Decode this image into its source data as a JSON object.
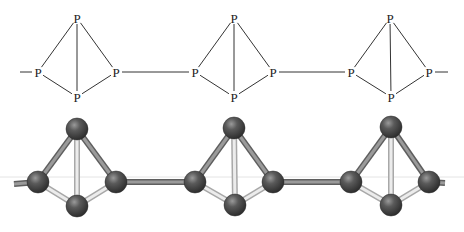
{
  "figure": {
    "element_label": "P",
    "colors": {
      "line": "#333333",
      "atom_dark": "#3a3a3a",
      "atom_highlight": "#8a8a8a",
      "bond_light": "#d8d8d8",
      "bond_dark": "#7a7a7a",
      "guide_line": "#e4e4e4"
    }
  },
  "structural_formula": {
    "units": [
      {
        "atoms": [
          {
            "id": "top",
            "label": "P",
            "x": 77,
            "y": 18
          },
          {
            "id": "left",
            "label": "P",
            "x": 38,
            "y": 72
          },
          {
            "id": "right",
            "label": "P",
            "x": 116,
            "y": 72
          },
          {
            "id": "bottom",
            "label": "P",
            "x": 77,
            "y": 97
          }
        ]
      },
      {
        "atoms": [
          {
            "id": "top",
            "label": "P",
            "x": 234,
            "y": 18
          },
          {
            "id": "left",
            "label": "P",
            "x": 195,
            "y": 72
          },
          {
            "id": "right",
            "label": "P",
            "x": 273,
            "y": 72
          },
          {
            "id": "bottom",
            "label": "P",
            "x": 234,
            "y": 97
          }
        ]
      },
      {
        "atoms": [
          {
            "id": "top",
            "label": "P",
            "x": 390,
            "y": 18
          },
          {
            "id": "left",
            "label": "P",
            "x": 351,
            "y": 72
          },
          {
            "id": "right",
            "label": "P",
            "x": 429,
            "y": 72
          },
          {
            "id": "bottom",
            "label": "P",
            "x": 391,
            "y": 97
          }
        ]
      }
    ],
    "chain_ends": {
      "left_start_x": 20,
      "right_end_x": 448,
      "y": 72
    }
  },
  "ball_and_stick": {
    "atom_radius": 11,
    "units": [
      {
        "atoms": [
          {
            "id": "top",
            "x": 77,
            "y": 129
          },
          {
            "id": "left",
            "x": 38,
            "y": 182
          },
          {
            "id": "right",
            "x": 116,
            "y": 182
          },
          {
            "id": "bottom",
            "x": 77,
            "y": 206
          }
        ]
      },
      {
        "atoms": [
          {
            "id": "top",
            "x": 234,
            "y": 128
          },
          {
            "id": "left",
            "x": 195,
            "y": 182
          },
          {
            "id": "right",
            "x": 273,
            "y": 182
          },
          {
            "id": "bottom",
            "x": 235,
            "y": 205
          }
        ]
      },
      {
        "atoms": [
          {
            "id": "top",
            "x": 391,
            "y": 127
          },
          {
            "id": "left",
            "x": 351,
            "y": 182
          },
          {
            "id": "right",
            "x": 429,
            "y": 182
          },
          {
            "id": "bottom",
            "x": 391,
            "y": 205
          }
        ]
      }
    ],
    "chain_ends": {
      "left_start_x": 14,
      "right_end_x": 445,
      "y": 184
    },
    "guide_line": {
      "x1": 0,
      "x2": 464,
      "y": 177
    }
  }
}
